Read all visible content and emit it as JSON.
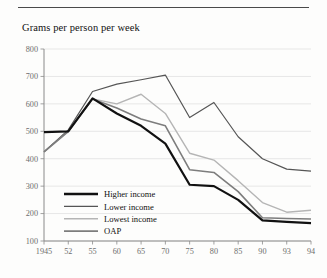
{
  "figure": {
    "title": "Grams per person per week",
    "has_top_rule": true
  },
  "chart_data": {
    "type": "line",
    "title": "Grams per person per week",
    "xlabel": "",
    "ylabel": "Grams per person per week",
    "x": [
      "1945",
      "52",
      "55",
      "60",
      "65",
      "70",
      "75",
      "80",
      "85",
      "90",
      "93",
      "94"
    ],
    "categories": [
      "1945",
      "52",
      "55",
      "60",
      "65",
      "70",
      "75",
      "80",
      "85",
      "90",
      "93",
      "94"
    ],
    "ylim": [
      100,
      800
    ],
    "yticks": [
      100,
      200,
      300,
      400,
      500,
      600,
      700,
      800
    ],
    "ytick_labels": [
      "100",
      "200",
      "300",
      "400",
      "500",
      "600",
      "700",
      "800"
    ],
    "grid": true,
    "grid_axis": "y",
    "legend_position": "inside-lower-left",
    "series": [
      {
        "name": "Higher income",
        "color": "#111111",
        "width": 2.2,
        "values": [
          497,
          500,
          620,
          565,
          520,
          455,
          305,
          300,
          250,
          175,
          170,
          165
        ]
      },
      {
        "name": "Lower income",
        "color": "#555555",
        "width": 1.2,
        "values": [
          425,
          505,
          645,
          672,
          688,
          705,
          550,
          605,
          480,
          400,
          362,
          355
        ]
      },
      {
        "name": "Lowest income",
        "color": "#b5b5b5",
        "width": 1.4,
        "values": [
          425,
          498,
          618,
          600,
          635,
          565,
          420,
          395,
          320,
          240,
          205,
          212
        ]
      },
      {
        "name": "OAP",
        "color": "#7d7d7d",
        "width": 1.6,
        "values": [
          425,
          500,
          618,
          585,
          545,
          520,
          360,
          350,
          280,
          185,
          182,
          180
        ]
      }
    ],
    "legend": [
      {
        "label": "Higher income",
        "color": "#111111",
        "width": 2.4
      },
      {
        "label": "Lower income",
        "color": "#555555",
        "width": 1.3
      },
      {
        "label": "Lowest income",
        "color": "#b5b5b5",
        "width": 1.4
      },
      {
        "label": "OAP",
        "color": "#7d7d7d",
        "width": 1.8
      }
    ]
  }
}
